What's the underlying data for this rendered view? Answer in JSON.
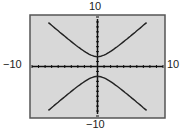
{
  "chart_data": {
    "type": "line",
    "title": "",
    "xlabel": "",
    "ylabel": "",
    "xlim": [
      -10,
      10
    ],
    "ylim": [
      -10,
      10
    ],
    "tick_labels": {
      "top": "10",
      "bottom": "-10",
      "left": "-10",
      "right": "10"
    },
    "series": [
      {
        "name": "upper branch",
        "equation": "y = sqrt(4 + 1.33 x^2)",
        "x": [
          -7.5,
          -5,
          -2.5,
          0,
          2.5,
          5,
          7.5
        ],
        "y": [
          9.0,
          6.1,
          3.5,
          2.0,
          3.5,
          6.1,
          9.0
        ]
      },
      {
        "name": "lower branch",
        "equation": "y = -sqrt(4 + 1.33 x^2)",
        "x": [
          -7.5,
          -5,
          -2.5,
          0,
          2.5,
          5,
          7.5
        ],
        "y": [
          -9.0,
          -6.1,
          -3.5,
          -2.0,
          -3.5,
          -6.1,
          -9.0
        ]
      }
    ],
    "grid": false,
    "axis_ticks_every": 1,
    "background": "#d8d8d8"
  },
  "labels": {
    "top": "10",
    "bottom": "−10",
    "left": "−10",
    "right": "10"
  }
}
